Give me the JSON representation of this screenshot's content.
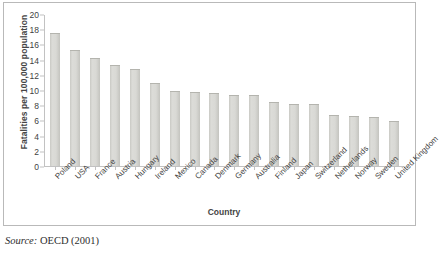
{
  "chart_data": {
    "type": "bar",
    "title": "",
    "xlabel": "Country",
    "ylabel": "Fatalities per 100,000 population",
    "ylim": [
      0,
      20
    ],
    "ytick_step": 2,
    "yticks": [
      20,
      18,
      16,
      14,
      12,
      10,
      8,
      6,
      4,
      2,
      0
    ],
    "grid": false,
    "legend": "none",
    "categories": [
      "Poland",
      "USA",
      "France",
      "Austria",
      "Hungary",
      "Ireland",
      "Mexico",
      "Canada",
      "Denmark",
      "Germany",
      "Australia",
      "Finland",
      "Japan",
      "Switzerland",
      "Netherlands",
      "Norway",
      "Sweden",
      "United Kingdom"
    ],
    "values": [
      17.5,
      15.3,
      14.2,
      13.3,
      12.8,
      10.9,
      9.9,
      9.7,
      9.6,
      9.4,
      9.3,
      8.4,
      8.1,
      8.1,
      6.7,
      6.6,
      6.4,
      5.9
    ]
  },
  "source_note": {
    "label": "Source:",
    "text": "OECD (2001)"
  },
  "colors": {
    "bar_fill": "#d9d9d5",
    "bar_edge": "#b4b4ae",
    "axis": "#c2c2c2",
    "frame": "#b9b9b9",
    "text": "#3f3f3f"
  }
}
